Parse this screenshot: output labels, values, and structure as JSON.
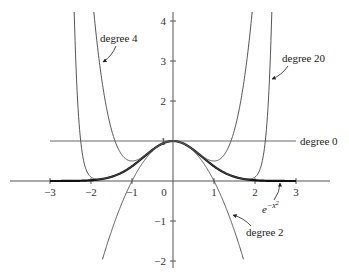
{
  "chart_data": {
    "type": "line",
    "title": "",
    "xlabel": "",
    "ylabel": "",
    "xlim": [
      -3.3,
      3.9
    ],
    "ylim": [
      -2.1,
      4.2
    ],
    "grid": false,
    "x_ticks": [
      -3,
      -2,
      -1,
      0,
      1,
      2,
      3
    ],
    "y_ticks": [
      -2,
      -1,
      1,
      2,
      3,
      4
    ],
    "x_tick_labels": [
      "−3",
      "−2",
      "−1",
      "0",
      "1",
      "2",
      "3"
    ],
    "y_tick_labels": [
      "−2",
      "−1",
      "1",
      "2",
      "3",
      "4"
    ],
    "series": [
      {
        "name": "e^{-x^2}",
        "label": "e−x2",
        "function": "exp(-x^2)",
        "style": "thick",
        "x_range": [
          -3,
          3
        ]
      },
      {
        "name": "degree 0",
        "label": "degree 0",
        "function": "1",
        "style": "thin",
        "x_range": [
          -3,
          3
        ]
      },
      {
        "name": "degree 2",
        "label": "degree 2",
        "function": "1 - x^2",
        "style": "thin",
        "x_range": [
          -1.72,
          1.72
        ]
      },
      {
        "name": "degree 4",
        "label": "degree 4",
        "function": "1 - x^2 + x^4/2",
        "style": "thin",
        "x_range": [
          -2.15,
          2.15
        ]
      },
      {
        "name": "degree 20",
        "label": "degree 20",
        "function": "sum_{k=0}^{10} (-1)^k x^{2k}/k!",
        "style": "thin",
        "x_range": [
          -2.45,
          2.45
        ]
      }
    ],
    "annotations": [
      {
        "text": "degree 4",
        "points_to": "degree 4 curve, left branch near (-1.7, 3.5)"
      },
      {
        "text": "degree 20",
        "points_to": "degree 20 curve, right branch near (2.3, 2.5)"
      },
      {
        "text": "degree 0",
        "points_to": "horizontal line y=1, right end"
      },
      {
        "text": "degree 2",
        "points_to": "degree 2 curve near (1.4, -1)"
      },
      {
        "text": "e^{-x^2}",
        "points_to": "thick curve near (2.6, 0)"
      }
    ]
  },
  "labels": {
    "deg4": "degree 4",
    "deg20": "degree 20",
    "deg0": "degree 0",
    "deg2": "degree 2",
    "gauss_base": "e",
    "gauss_exp": "−x",
    "gauss_sq": "2"
  }
}
